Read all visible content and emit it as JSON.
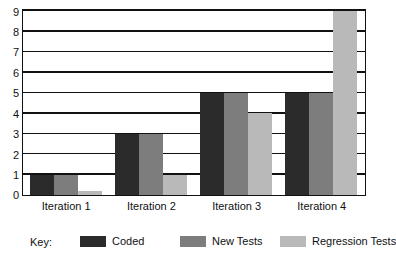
{
  "chart_data": {
    "type": "bar",
    "title": "",
    "subtitle": "",
    "xlabel": "",
    "ylabel": "",
    "ylim": [
      0,
      9
    ],
    "yticks": [
      0,
      1,
      2,
      3,
      4,
      5,
      6,
      7,
      8,
      9
    ],
    "ytick_labels": [
      "0",
      "1",
      "2",
      "3",
      "4",
      "5",
      "6",
      "7",
      "8",
      "9"
    ],
    "grid": true,
    "grid_axis": "y",
    "legend_position": "bottom",
    "legend_title": "Key:",
    "categories": [
      "Iteration 1",
      "Iteration 2",
      "Iteration 3",
      "Iteration 4"
    ],
    "series": [
      {
        "name": "Coded",
        "color": "#2b2b2b",
        "values": [
          1,
          3,
          5,
          5
        ]
      },
      {
        "name": "New Tests",
        "color": "#7d7d7d",
        "values": [
          1,
          3,
          5,
          5
        ]
      },
      {
        "name": "Regression Tests",
        "color": "#b9b9b9",
        "values": [
          0.2,
          1,
          4,
          9
        ]
      }
    ]
  },
  "colors": {
    "axis": "#111111",
    "plot_background": "#ffffff",
    "page_background": "#ffffff"
  }
}
